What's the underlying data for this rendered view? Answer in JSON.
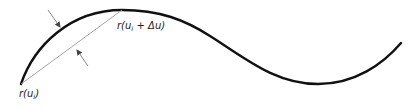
{
  "diagram": {
    "colors": {
      "curve": "#111111",
      "chord": "#9a9a9a",
      "arrow": "#777777",
      "text": "#222222",
      "background": "#ffffff"
    },
    "labels": {
      "start_point": {
        "prefix": "r(u",
        "subscript": "i",
        "suffix": ")"
      },
      "end_point": {
        "prefix": "r(u",
        "subscript": "i",
        "suffix": " + Δu)"
      }
    },
    "elements": {
      "curve": "smooth sinusoidal curve",
      "chord": "straight segment from r(u_i) to r(u_i + Δu)",
      "deviation_arrows": "two opposing arrows indicating chordal deviation between curve and chord"
    }
  }
}
